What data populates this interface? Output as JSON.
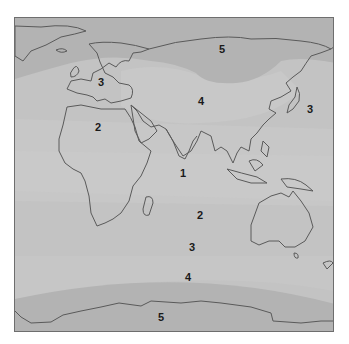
{
  "map": {
    "title": "",
    "colors": {
      "zone1": "#c9c9c9",
      "zone2": "#c6c6c6",
      "zone3": "#c3c3c3",
      "zone4": "#c6c6c6",
      "zone5": "#b3b3b3",
      "coastline": "#5a5a5a",
      "frame": "#6e6e6e"
    },
    "labels": [
      {
        "text": "5",
        "x": 221,
        "y": 48,
        "region": "Siberia"
      },
      {
        "text": "3",
        "x": 100,
        "y": 81,
        "region": "Europe"
      },
      {
        "text": "4",
        "x": 200,
        "y": 100,
        "region": "Central Asia"
      },
      {
        "text": "3",
        "x": 309,
        "y": 108,
        "region": "North Pacific"
      },
      {
        "text": "2",
        "x": 97,
        "y": 126,
        "region": "North Africa"
      },
      {
        "text": "1",
        "x": 182,
        "y": 172,
        "region": "Indian Ocean (equatorial)"
      },
      {
        "text": "2",
        "x": 199,
        "y": 214,
        "region": "South Indian Ocean"
      },
      {
        "text": "3",
        "x": 191,
        "y": 246,
        "region": "Southern Ocean"
      },
      {
        "text": "4",
        "x": 187,
        "y": 276,
        "region": "Southern Ocean"
      },
      {
        "text": "5",
        "x": 160,
        "y": 316,
        "region": "Antarctica"
      }
    ]
  }
}
